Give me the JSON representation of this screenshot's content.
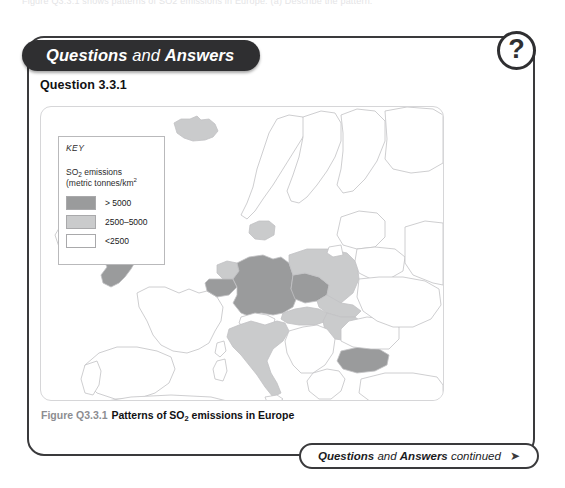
{
  "page": {
    "top_cutoff_text": "Figure Q3.3.1 shows patterns of SO2 emissions in Europe. (a) Describe the pattern."
  },
  "header": {
    "title_bold_1": "Questions",
    "title_normal": " and ",
    "title_bold_2": "Answers",
    "badge_icon": "question-mark-icon",
    "badge_label": "?"
  },
  "question": {
    "label": "Question 3.3.1"
  },
  "key": {
    "title": "KEY",
    "subtitle_line1_pre": "SO",
    "subtitle_line1_sub": "2",
    "subtitle_line1_post": " emissions",
    "subtitle_line2_pre": "(metric tonnes/km",
    "subtitle_line2_sup": "2",
    "items": [
      {
        "label": "> 5000",
        "color": "#9a9b9c"
      },
      {
        "label": "2500–5000",
        "color": "#cacbcc"
      },
      {
        "label": "<2500",
        "color": "#ffffff"
      }
    ]
  },
  "figure": {
    "caption_number": "Figure Q3.3.1",
    "caption_text_pre": "Patterns of SO",
    "caption_text_sub": "2",
    "caption_text_post": " emissions in Europe"
  },
  "footer": {
    "text_bold_1": "Questions",
    "text_normal_1": " and ",
    "text_bold_2": "Answers",
    "text_normal_2": " continued",
    "arrow_icon": "arrow-right-icon",
    "arrow_glyph": "➤"
  },
  "colors": {
    "panel_border": "#3a3a3c",
    "header_pill_bg": "#2f2f31",
    "high_emission": "#9a9b9c",
    "mid_emission": "#cacbcc",
    "low_emission": "#ffffff",
    "map_outline": "#c2c2c4",
    "caption_number": "#8d8d91"
  },
  "map_data": {
    "type": "choropleth",
    "region": "Europe",
    "variable": "SO2 emissions (metric tonnes/km2)",
    "classes": [
      "> 5000",
      "2500–5000",
      "<2500"
    ],
    "countries": [
      {
        "name": "United Kingdom",
        "class": "> 5000"
      },
      {
        "name": "Belgium",
        "class": "> 5000"
      },
      {
        "name": "Germany",
        "class": "> 5000"
      },
      {
        "name": "Czech Republic",
        "class": "> 5000"
      },
      {
        "name": "Bulgaria",
        "class": "> 5000"
      },
      {
        "name": "Iceland",
        "class": "2500–5000"
      },
      {
        "name": "Netherlands",
        "class": "2500–5000"
      },
      {
        "name": "Poland",
        "class": "2500–5000"
      },
      {
        "name": "Slovakia",
        "class": "2500–5000"
      },
      {
        "name": "Hungary",
        "class": "2500–5000"
      },
      {
        "name": "Italy",
        "class": "2500–5000"
      },
      {
        "name": "Austria",
        "class": "2500–5000"
      },
      {
        "name": "Denmark",
        "class": "2500–5000"
      },
      {
        "name": "Ireland",
        "class": "<2500"
      },
      {
        "name": "France",
        "class": "<2500"
      },
      {
        "name": "Spain",
        "class": "<2500"
      },
      {
        "name": "Portugal",
        "class": "<2500"
      },
      {
        "name": "Norway",
        "class": "<2500"
      },
      {
        "name": "Sweden",
        "class": "<2500"
      },
      {
        "name": "Finland",
        "class": "<2500"
      },
      {
        "name": "Switzerland",
        "class": "<2500"
      },
      {
        "name": "Romania",
        "class": "<2500"
      },
      {
        "name": "Greece",
        "class": "<2500"
      },
      {
        "name": "Baltic States",
        "class": "<2500"
      },
      {
        "name": "Belarus",
        "class": "<2500"
      },
      {
        "name": "Ukraine",
        "class": "<2500"
      },
      {
        "name": "Former Yugoslavia",
        "class": "<2500"
      }
    ]
  }
}
